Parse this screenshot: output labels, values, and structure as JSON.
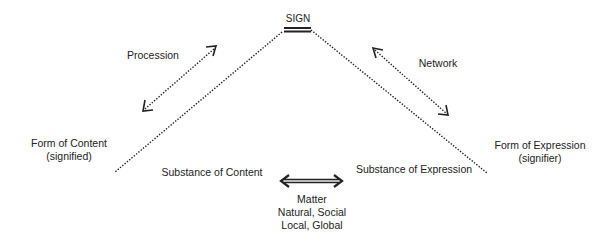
{
  "diagram": {
    "title": "SIGN",
    "top_node": {
      "label": "SIGN"
    },
    "left_pole": {
      "line1": "Form of Content",
      "line2": "(signified)"
    },
    "right_pole": {
      "line1": "Form of Expression",
      "line2": "(signifier)"
    },
    "left_substance": {
      "label": "Substance of Content"
    },
    "right_substance": {
      "label": "Substance of Expression"
    },
    "left_movement": {
      "label": "Procession",
      "icon": "dotted-double-arrow"
    },
    "right_movement": {
      "label": "Network",
      "icon": "dotted-double-arrow"
    },
    "matter": {
      "label": "Matter",
      "line2": "Natural, Social",
      "line3": "Local, Global",
      "icon": "double-line-double-arrow"
    },
    "colors": {
      "line": "#222222",
      "text": "#222222",
      "background": "#ffffff"
    }
  }
}
